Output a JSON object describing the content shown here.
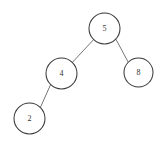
{
  "figure": {
    "kind": "binary-search-tree-diagram",
    "background_color": "#ffffff",
    "node_fill_color": "#ffffff",
    "node_stroke_color": "#3a3a3a",
    "edge_stroke_color": "#666666",
    "label_color": "#333333"
  },
  "tree": {
    "nodes": [
      {
        "id": "root",
        "label": "5",
        "cx": 104.5,
        "cy": 28.5,
        "r": 15.5
      },
      {
        "id": "left",
        "label": "4",
        "cx": 61.5,
        "cy": 73.5,
        "r": 15.5
      },
      {
        "id": "right",
        "label": "8",
        "cx": 138.5,
        "cy": 72.5,
        "r": 14.5
      },
      {
        "id": "left-left",
        "label": "2",
        "cx": 29.5,
        "cy": 118.5,
        "r": 15.5
      }
    ],
    "edges": [
      {
        "id": "edge-root-left",
        "from": "root",
        "to": "left",
        "x1": 93.6,
        "y1": 39.6,
        "x2": 72.4,
        "y2": 62.4
      },
      {
        "id": "edge-root-right",
        "from": "root",
        "to": "right",
        "x1": 115.9,
        "y1": 39.2,
        "x2": 128.2,
        "y2": 62.1
      },
      {
        "id": "edge-left-leftleft",
        "from": "left",
        "to": "left-left",
        "x1": 50.6,
        "y1": 84.6,
        "x2": 40.4,
        "y2": 107.4
      }
    ]
  }
}
